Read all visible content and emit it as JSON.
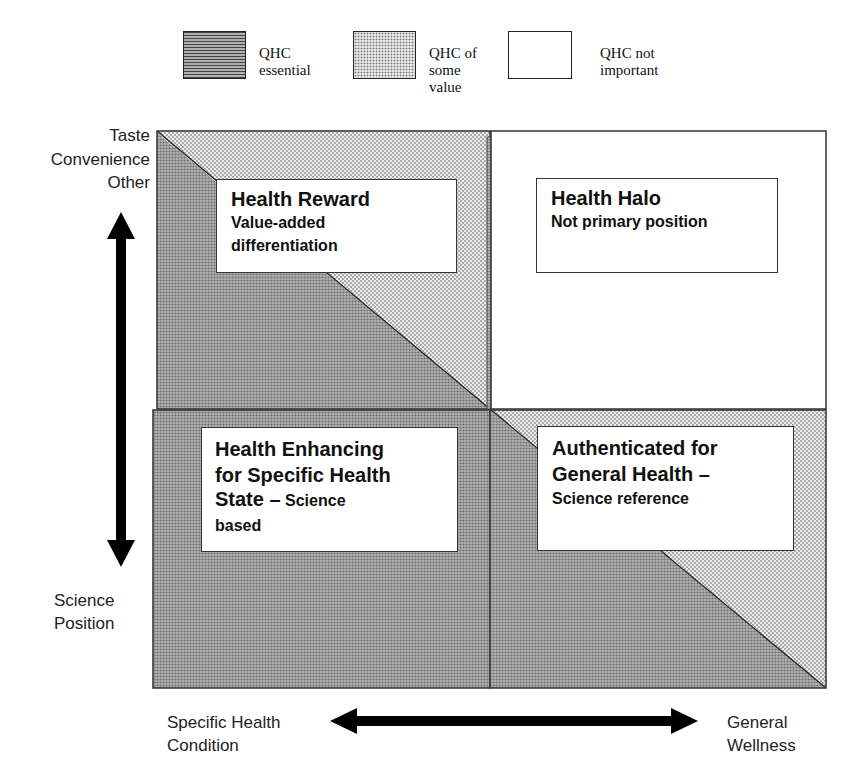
{
  "legend": {
    "items": [
      {
        "label_line1": "QHC",
        "label_line2": "essential",
        "label_line3": "",
        "pattern": "dark-dense"
      },
      {
        "label_line1": "QHC of",
        "label_line2": "some",
        "label_line3": "value",
        "pattern": "light-dotted"
      },
      {
        "label_line1": "QHC not",
        "label_line2": "important",
        "label_line3": "",
        "pattern": "white"
      }
    ]
  },
  "y_axis": {
    "top_label": [
      "Taste",
      "Convenience",
      "Other"
    ],
    "bottom_label": [
      "Science",
      "Position"
    ]
  },
  "x_axis": {
    "left_label": [
      "Specific Health",
      "Condition"
    ],
    "right_label": [
      "General",
      "Wellness"
    ]
  },
  "quadrants": {
    "top_left": {
      "title": "Health Reward",
      "subtitle_line1": "Value-added",
      "subtitle_line2": "differentiation"
    },
    "top_right": {
      "title": "Health Halo",
      "subtitle_line1": "Not primary position"
    },
    "bottom_left": {
      "title_line1": "Health Enhancing",
      "title_line2": "for Specific Health",
      "title_line3": "State –",
      "subtitle_inline": "Science",
      "subtitle_line2": "based"
    },
    "bottom_right": {
      "title_line1": "Authenticated for",
      "title_line2": "General Health –",
      "subtitle_line1": "Science reference"
    }
  },
  "colors": {
    "dark_fill": "#9a9a9a",
    "light_fill": "#e4e4e4",
    "white_fill": "#ffffff",
    "line": "#222222",
    "arrow": "#000000"
  }
}
